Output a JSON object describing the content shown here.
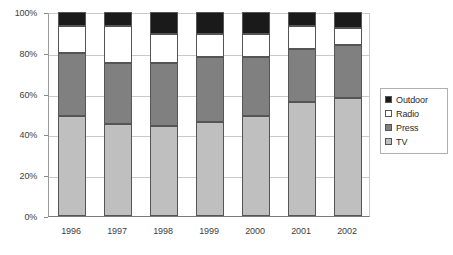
{
  "chart_data": {
    "type": "bar",
    "subtype": "stacked-100-percent",
    "title": "",
    "xlabel": "",
    "ylabel": "",
    "categories": [
      "1996",
      "1997",
      "1998",
      "1999",
      "2000",
      "2001",
      "2002"
    ],
    "series": [
      {
        "name": "TV",
        "color": "#bfbfbf",
        "values": [
          49,
          45,
          44,
          46,
          49,
          56,
          58
        ]
      },
      {
        "name": "Press",
        "color": "#808080",
        "values": [
          31,
          30,
          31,
          32,
          29,
          26,
          26
        ]
      },
      {
        "name": "Radio",
        "color": "#ffffff",
        "values": [
          13,
          18,
          14,
          11,
          11,
          11,
          8
        ]
      },
      {
        "name": "Outdoor",
        "color": "#1a1a1a",
        "values": [
          7,
          7,
          11,
          11,
          11,
          7,
          8
        ]
      }
    ],
    "ylim": [
      0,
      100
    ],
    "yticks": [
      0,
      20,
      40,
      60,
      80,
      100
    ],
    "ytick_labels": [
      "0%",
      "20%",
      "40%",
      "60%",
      "80%",
      "100%"
    ],
    "grid": true,
    "legend_position": "right",
    "legend_entries": [
      "Outdoor",
      "Radio",
      "Press",
      "TV"
    ]
  }
}
